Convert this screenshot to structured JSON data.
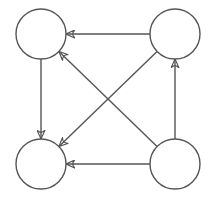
{
  "diagram": {
    "type": "directed-graph",
    "stroke_color": "#555555",
    "background": "#ffffff",
    "nodes": [
      {
        "id": "top-left",
        "cx": 41,
        "cy": 34,
        "r": 25,
        "label": ""
      },
      {
        "id": "top-right",
        "cx": 175,
        "cy": 34,
        "r": 25,
        "label": ""
      },
      {
        "id": "bottom-left",
        "cx": 41,
        "cy": 164,
        "r": 25,
        "label": ""
      },
      {
        "id": "bottom-right",
        "cx": 175,
        "cy": 164,
        "r": 25,
        "label": ""
      }
    ],
    "edges": [
      {
        "from": "top-right",
        "to": "top-left"
      },
      {
        "from": "top-left",
        "to": "bottom-left"
      },
      {
        "from": "bottom-right",
        "to": "bottom-left"
      },
      {
        "from": "bottom-right",
        "to": "top-right"
      },
      {
        "from": "bottom-right",
        "to": "top-left"
      },
      {
        "from": "top-right",
        "to": "bottom-left"
      }
    ]
  }
}
